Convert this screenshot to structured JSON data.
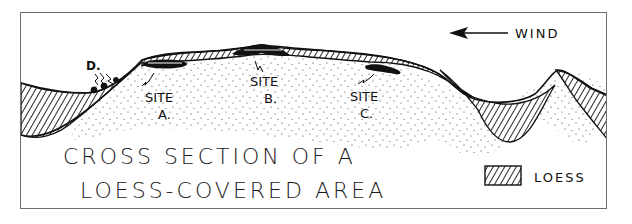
{
  "diagram": {
    "title_line1": "CROSS SECTION OF A",
    "title_line2": "LOESS-COVERED AREA",
    "wind_label": "WIND",
    "legend": {
      "label": "LOESS",
      "pattern": "diagonal-hatch"
    },
    "sites": [
      {
        "word": "SITE",
        "letter": "A."
      },
      {
        "word": "SITE",
        "letter": "B."
      },
      {
        "word": "SITE",
        "letter": "C."
      }
    ],
    "marker_d": "D.",
    "colors": {
      "ink": "#111111",
      "frame": "#6e6e6e",
      "background": "#ffffff"
    }
  }
}
